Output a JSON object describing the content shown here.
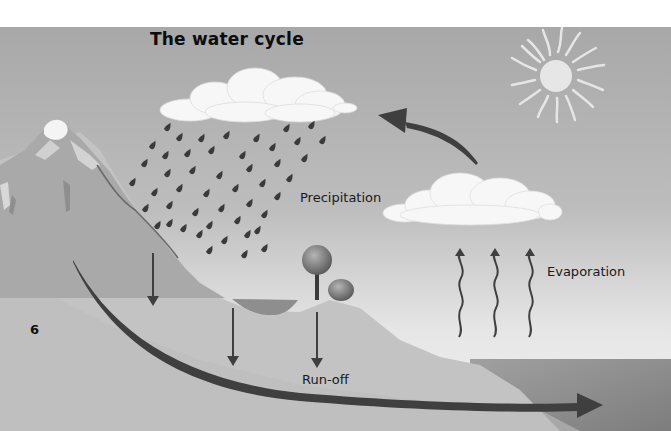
{
  "title": "The water cycle",
  "page_number": "6",
  "labels": {
    "precipitation": "Precipitation",
    "evaporation": "Evaporation",
    "runoff": "Run-off"
  },
  "elements": {
    "sun": "sun-icon",
    "rain_cloud": "rain-cloud",
    "evaporation_cloud": "evaporation-cloud",
    "mountain": "snow-capped-mountain",
    "lake": "lake",
    "trees": "trees",
    "sea": "sea",
    "condensation_arrow": "curved-arrow-to-cloud",
    "evaporation_arrows": 3,
    "infiltration_arrows": 3,
    "runoff_arrow": "long-arrow-to-sea"
  },
  "colors": {
    "sky_top": "#a9a9a9",
    "sky_bottom": "#f1f1f1",
    "ground": "#c2c2c2",
    "sea": "#8a8a8a",
    "arrow": "#3f3f3f",
    "raindrop": "#3a3a3a",
    "cloud": "#f7f7f7",
    "sun": "#e6e6e6"
  }
}
